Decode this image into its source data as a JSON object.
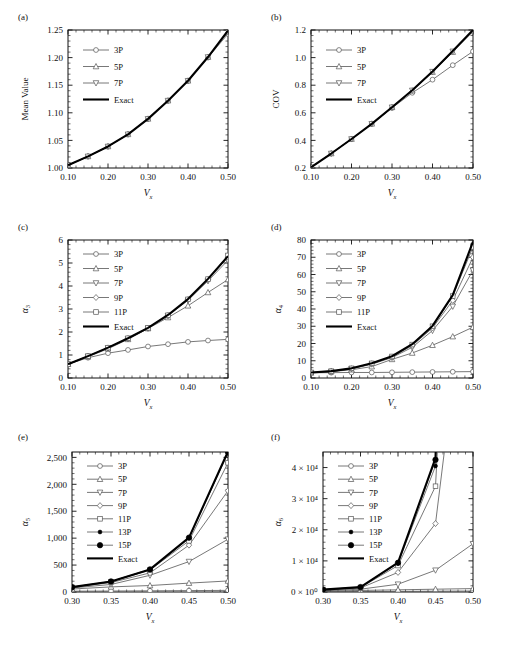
{
  "figure": {
    "background": "#ffffff",
    "axis_color": "#111111",
    "series_color": "#555555",
    "exact_color": "#000000"
  },
  "panels": [
    {
      "id": "a",
      "label": "(a)",
      "ylabel": "Mean Value",
      "xlabel": "Vx",
      "xlabel_main": "V",
      "xlabel_sub": "x",
      "xlim": [
        0.1,
        0.5
      ],
      "ylim": [
        1.0,
        1.25
      ],
      "xticks": [
        "0.10",
        "0.20",
        "0.30",
        "0.40",
        "0.50"
      ],
      "xtickvals": [
        0.1,
        0.2,
        0.3,
        0.4,
        0.5
      ],
      "yticks": [
        "1.00",
        "1.05",
        "1.10",
        "1.15",
        "1.20",
        "1.25"
      ],
      "ytickvals": [
        1.0,
        1.05,
        1.1,
        1.15,
        1.2,
        1.25
      ],
      "legend": [
        "3P",
        "5P",
        "7P",
        "Exact"
      ],
      "legend_markers": [
        "circle",
        "triangle-up",
        "triangle-down",
        "line"
      ]
    },
    {
      "id": "b",
      "label": "(b)",
      "ylabel": "COV",
      "xlabel": "Vx",
      "xlabel_main": "V",
      "xlabel_sub": "x",
      "xlim": [
        0.1,
        0.5
      ],
      "ylim": [
        0.2,
        1.2
      ],
      "xticks": [
        "0.10",
        "0.20",
        "0.30",
        "0.40",
        "0.50"
      ],
      "xtickvals": [
        0.1,
        0.2,
        0.3,
        0.4,
        0.5
      ],
      "yticks": [
        "0.2",
        "0.4",
        "0.6",
        "0.8",
        "1.0",
        "1.2"
      ],
      "ytickvals": [
        0.2,
        0.4,
        0.6,
        0.8,
        1.0,
        1.2
      ],
      "legend": [
        "3P",
        "5P",
        "7P",
        "Exact"
      ],
      "legend_markers": [
        "circle",
        "triangle-up",
        "triangle-down",
        "line"
      ]
    },
    {
      "id": "c",
      "label": "(c)",
      "ylabel": "alpha3",
      "ylabel_main": "α",
      "ylabel_sub": "3",
      "xlabel_main": "V",
      "xlabel_sub": "x",
      "xlim": [
        0.1,
        0.5
      ],
      "ylim": [
        0,
        6
      ],
      "xticks": [
        "0.10",
        "0.20",
        "0.30",
        "0.40",
        "0.50"
      ],
      "xtickvals": [
        0.1,
        0.2,
        0.3,
        0.4,
        0.5
      ],
      "yticks": [
        "0",
        "1",
        "2",
        "3",
        "4",
        "5",
        "6"
      ],
      "ytickvals": [
        0,
        1,
        2,
        3,
        4,
        5,
        6
      ],
      "legend": [
        "3P",
        "5P",
        "7P",
        "9P",
        "11P",
        "Exact"
      ],
      "legend_markers": [
        "circle",
        "triangle-up",
        "triangle-down",
        "diamond",
        "square",
        "line"
      ]
    },
    {
      "id": "d",
      "label": "(d)",
      "ylabel": "alpha4",
      "ylabel_main": "α",
      "ylabel_sub": "4",
      "xlabel_main": "V",
      "xlabel_sub": "x",
      "xlim": [
        0.1,
        0.5
      ],
      "ylim": [
        0,
        80
      ],
      "xticks": [
        "0.10",
        "0.20",
        "0.30",
        "0.40",
        "0.50"
      ],
      "xtickvals": [
        0.1,
        0.2,
        0.3,
        0.4,
        0.5
      ],
      "yticks": [
        "0",
        "10",
        "20",
        "30",
        "40",
        "50",
        "60",
        "70",
        "80"
      ],
      "ytickvals": [
        0,
        10,
        20,
        30,
        40,
        50,
        60,
        70,
        80
      ],
      "legend": [
        "3P",
        "5P",
        "7P",
        "9P",
        "11P",
        "Exact"
      ],
      "legend_markers": [
        "circle",
        "triangle-up",
        "triangle-down",
        "diamond",
        "square",
        "line"
      ]
    },
    {
      "id": "e",
      "label": "(e)",
      "ylabel": "alpha5",
      "ylabel_main": "α",
      "ylabel_sub": "5",
      "xlabel_main": "V",
      "xlabel_sub": "x",
      "xlim": [
        0.3,
        0.5
      ],
      "ylim": [
        0,
        2600
      ],
      "xticks": [
        "0.30",
        "0.35",
        "0.40",
        "0.45",
        "0.50"
      ],
      "xtickvals": [
        0.3,
        0.35,
        0.4,
        0.45,
        0.5
      ],
      "yticks": [
        "0",
        "500",
        "1,000",
        "1,500",
        "2,000",
        "2,500"
      ],
      "ytickvals": [
        0,
        500,
        1000,
        1500,
        2000,
        2500
      ],
      "legend": [
        "3P",
        "5P",
        "7P",
        "9P",
        "11P",
        "13P",
        "15P",
        "Exact"
      ],
      "legend_markers": [
        "circle",
        "triangle-up",
        "triangle-down",
        "diamond",
        "square",
        "dot-small",
        "dot-large",
        "line"
      ]
    },
    {
      "id": "f",
      "label": "(f)",
      "ylabel": "alpha6",
      "ylabel_main": "α",
      "ylabel_sub": "6",
      "xlabel_main": "V",
      "xlabel_sub": "x",
      "xlim": [
        0.3,
        0.5
      ],
      "ylim": [
        0,
        45000
      ],
      "xticks": [
        "0.30",
        "0.35",
        "0.40",
        "0.45",
        "0.50"
      ],
      "xtickvals": [
        0.3,
        0.35,
        0.4,
        0.45,
        0.5
      ],
      "yticks": [
        "0 × 10⁰",
        "1 × 10⁴",
        "2 × 10⁴",
        "3 × 10⁴",
        "4 × 10⁴"
      ],
      "ytickvals": [
        0,
        10000,
        20000,
        30000,
        40000
      ],
      "legend": [
        "3P",
        "5P",
        "7P",
        "9P",
        "11P",
        "13P",
        "15P",
        "Exact"
      ],
      "legend_markers": [
        "circle",
        "triangle-up",
        "triangle-down",
        "diamond",
        "square",
        "dot-small",
        "dot-large",
        "line"
      ]
    }
  ],
  "chart_data": [
    {
      "type": "line",
      "panel": "a",
      "title": "(a)",
      "xlabel": "Vx",
      "ylabel": "Mean Value",
      "xlim": [
        0.1,
        0.5
      ],
      "ylim": [
        1.0,
        1.25
      ],
      "grid": false,
      "legend_position": "upper-left",
      "x": [
        0.1,
        0.15,
        0.2,
        0.25,
        0.3,
        0.35,
        0.4,
        0.45,
        0.5
      ],
      "series": [
        {
          "name": "3P",
          "marker": "circle",
          "values": [
            1.005,
            1.021,
            1.039,
            1.061,
            1.089,
            1.122,
            1.158,
            1.2,
            1.243
          ]
        },
        {
          "name": "5P",
          "marker": "triangle-up",
          "values": [
            1.005,
            1.021,
            1.039,
            1.061,
            1.089,
            1.122,
            1.158,
            1.201,
            1.246
          ]
        },
        {
          "name": "7P",
          "marker": "triangle-down",
          "values": [
            1.005,
            1.021,
            1.039,
            1.061,
            1.089,
            1.122,
            1.158,
            1.201,
            1.248
          ]
        },
        {
          "name": "Exact",
          "marker": "line",
          "values": [
            1.005,
            1.021,
            1.039,
            1.061,
            1.089,
            1.122,
            1.158,
            1.201,
            1.249
          ]
        }
      ]
    },
    {
      "type": "line",
      "panel": "b",
      "title": "(b)",
      "xlabel": "Vx",
      "ylabel": "COV",
      "xlim": [
        0.1,
        0.5
      ],
      "ylim": [
        0.2,
        1.2
      ],
      "grid": false,
      "legend_position": "upper-left",
      "x": [
        0.1,
        0.15,
        0.2,
        0.25,
        0.3,
        0.35,
        0.4,
        0.45,
        0.5
      ],
      "series": [
        {
          "name": "3P",
          "marker": "circle",
          "values": [
            0.205,
            0.305,
            0.41,
            0.52,
            0.635,
            0.745,
            0.84,
            0.945,
            1.045
          ]
        },
        {
          "name": "5P",
          "marker": "triangle-up",
          "values": [
            0.205,
            0.305,
            0.41,
            0.52,
            0.64,
            0.76,
            0.895,
            1.04,
            1.19
          ]
        },
        {
          "name": "7P",
          "marker": "triangle-down",
          "values": [
            0.205,
            0.305,
            0.41,
            0.52,
            0.64,
            0.762,
            0.898,
            1.045,
            1.198
          ]
        },
        {
          "name": "Exact",
          "marker": "line",
          "values": [
            0.205,
            0.305,
            0.41,
            0.52,
            0.64,
            0.763,
            0.9,
            1.047,
            1.2
          ]
        }
      ]
    },
    {
      "type": "line",
      "panel": "c",
      "title": "(c)",
      "xlabel": "Vx",
      "ylabel": "α3",
      "xlim": [
        0.1,
        0.5
      ],
      "ylim": [
        0,
        6
      ],
      "grid": false,
      "legend_position": "upper-left",
      "x": [
        0.1,
        0.15,
        0.2,
        0.25,
        0.3,
        0.35,
        0.4,
        0.45,
        0.5
      ],
      "series": [
        {
          "name": "3P",
          "marker": "circle",
          "values": [
            0.6,
            0.88,
            1.08,
            1.22,
            1.37,
            1.47,
            1.57,
            1.63,
            1.68
          ]
        },
        {
          "name": "5P",
          "marker": "triangle-up",
          "values": [
            0.6,
            0.92,
            1.27,
            1.68,
            2.15,
            2.63,
            3.14,
            3.72,
            4.28
          ]
        },
        {
          "name": "7P",
          "marker": "triangle-down",
          "values": [
            0.6,
            0.94,
            1.3,
            1.7,
            2.16,
            2.7,
            3.38,
            4.22,
            5.12
          ]
        },
        {
          "name": "9P",
          "marker": "diamond",
          "values": [
            0.6,
            0.95,
            1.31,
            1.72,
            2.17,
            2.72,
            3.41,
            4.28,
            5.25
          ]
        },
        {
          "name": "11P",
          "marker": "square",
          "values": [
            0.6,
            0.95,
            1.32,
            1.73,
            2.18,
            2.73,
            3.42,
            4.3,
            5.33
          ]
        },
        {
          "name": "Exact",
          "marker": "line",
          "values": [
            0.6,
            0.95,
            1.32,
            1.73,
            2.18,
            2.74,
            3.43,
            4.31,
            5.3
          ]
        }
      ]
    },
    {
      "type": "line",
      "panel": "d",
      "title": "(d)",
      "xlabel": "Vx",
      "ylabel": "α4",
      "xlim": [
        0.1,
        0.5
      ],
      "ylim": [
        0,
        80
      ],
      "grid": false,
      "legend_position": "upper-left",
      "x": [
        0.1,
        0.15,
        0.2,
        0.25,
        0.3,
        0.35,
        0.4,
        0.45,
        0.5
      ],
      "series": [
        {
          "name": "3P",
          "marker": "circle",
          "values": [
            3.0,
            3.1,
            3.2,
            3.2,
            3.3,
            3.4,
            3.5,
            3.6,
            3.7
          ]
        },
        {
          "name": "5P",
          "marker": "triangle-up",
          "values": [
            3.0,
            3.7,
            4.8,
            6.6,
            10.8,
            14.5,
            19.0,
            24.0,
            29.5
          ]
        },
        {
          "name": "7P",
          "marker": "triangle-down",
          "values": [
            3.1,
            3.8,
            5.3,
            8.0,
            11.8,
            17.8,
            27.5,
            41.5,
            62.5
          ]
        },
        {
          "name": "9P",
          "marker": "diamond",
          "values": [
            3.1,
            3.8,
            5.4,
            8.3,
            12.2,
            18.8,
            29.0,
            45.0,
            70.0
          ]
        },
        {
          "name": "11P",
          "marker": "square",
          "values": [
            3.2,
            3.9,
            5.6,
            8.5,
            12.5,
            19.4,
            30.0,
            47.5,
            76.0
          ]
        },
        {
          "name": "Exact",
          "marker": "line",
          "values": [
            3.2,
            4.0,
            5.6,
            8.6,
            12.6,
            19.6,
            30.2,
            48.0,
            79.0
          ]
        }
      ]
    },
    {
      "type": "line",
      "panel": "e",
      "title": "(e)",
      "xlabel": "Vx",
      "ylabel": "α5",
      "xlim": [
        0.3,
        0.5
      ],
      "ylim": [
        0,
        2600
      ],
      "grid": false,
      "legend_position": "upper-left",
      "x": [
        0.3,
        0.35,
        0.4,
        0.45,
        0.5
      ],
      "series": [
        {
          "name": "3P",
          "marker": "circle",
          "values": [
            15,
            18,
            22,
            26,
            30
          ]
        },
        {
          "name": "5P",
          "marker": "triangle-up",
          "values": [
            55,
            95,
            120,
            165,
            205
          ]
        },
        {
          "name": "7P",
          "marker": "triangle-down",
          "values": [
            75,
            140,
            310,
            565,
            980
          ]
        },
        {
          "name": "9P",
          "marker": "diamond",
          "values": [
            85,
            175,
            355,
            870,
            1880
          ]
        },
        {
          "name": "11P",
          "marker": "square",
          "values": [
            88,
            190,
            408,
            950,
            2400
          ]
        },
        {
          "name": "13P",
          "marker": "dot-small",
          "values": [
            90,
            195,
            418,
            1000,
            2580
          ]
        },
        {
          "name": "15P",
          "marker": "dot-large",
          "values": [
            90,
            196,
            420,
            1010,
            2600
          ]
        },
        {
          "name": "Exact",
          "marker": "line",
          "values": [
            90,
            196,
            420,
            1010,
            2610
          ]
        }
      ]
    },
    {
      "type": "line",
      "panel": "f",
      "title": "(f)",
      "xlabel": "Vx",
      "ylabel": "α6",
      "xlim": [
        0.3,
        0.5
      ],
      "ylim": [
        0,
        45000
      ],
      "grid": false,
      "legend_position": "upper-left",
      "x": [
        0.3,
        0.35,
        0.4,
        0.45,
        0.5
      ],
      "series": [
        {
          "name": "3P",
          "marker": "circle",
          "values": [
            100,
            150,
            200,
            260,
            320
          ]
        },
        {
          "name": "5P",
          "marker": "triangle-up",
          "values": [
            250,
            500,
            700,
            900,
            1100
          ]
        },
        {
          "name": "7P",
          "marker": "triangle-down",
          "values": [
            400,
            900,
            2500,
            7000,
            15500
          ]
        },
        {
          "name": "9P",
          "marker": "diamond",
          "values": [
            600,
            1300,
            6300,
            22000,
            120000
          ]
        },
        {
          "name": "11P",
          "marker": "square",
          "values": [
            700,
            1450,
            8500,
            34000,
            260000
          ]
        },
        {
          "name": "13P",
          "marker": "dot-small",
          "values": [
            750,
            1550,
            9200,
            40500,
            430000
          ]
        },
        {
          "name": "15P",
          "marker": "dot-large",
          "values": [
            760,
            1580,
            9400,
            42500,
            470000
          ]
        },
        {
          "name": "Exact",
          "marker": "line",
          "values": [
            760,
            1580,
            9450,
            43000,
            480000
          ]
        }
      ]
    }
  ]
}
